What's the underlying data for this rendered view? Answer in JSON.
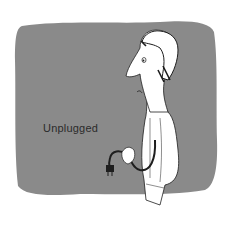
{
  "illustration": {
    "caption": "Unplugged",
    "subject": "man-holding-unplugged-cord",
    "colors": {
      "background": "#ffffff",
      "panel": "#8a8a8a",
      "ink": "#1e1e1e",
      "figure": "#ffffff"
    }
  }
}
